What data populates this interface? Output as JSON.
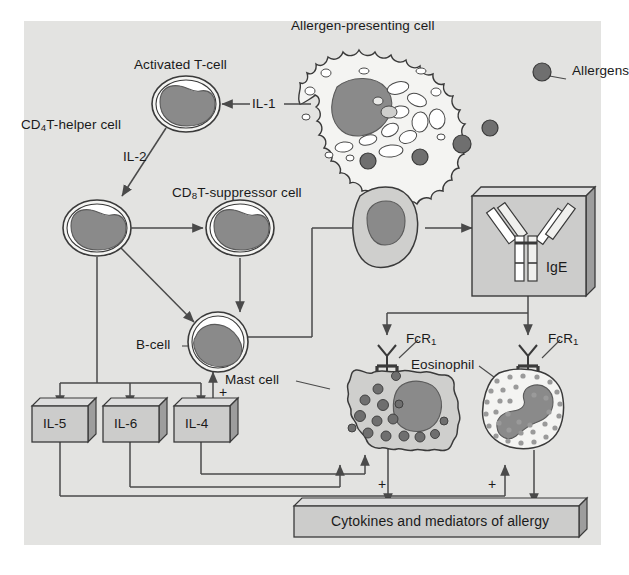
{
  "figure": {
    "background": "#e3e3e1",
    "page_background": "#ffffff",
    "ink": "#3a3a3a",
    "text_color": "#1a1a1a"
  },
  "palette": {
    "nucleus_gray": "#8a8a8a",
    "nucleus_dark": "#7e7e7e",
    "cytoplasm_light": "#f4f4f2",
    "cytoplasm_mid": "#d6d6d4",
    "allergen_dot": "#6f6f6f",
    "box_face": "#cccccb",
    "box_top": "#dedede",
    "box_side": "#9d9d9d",
    "mast_granule": "#6f6f6f",
    "eos_granule": "#9a9a9a",
    "line": "#4a4a4a"
  },
  "labels": {
    "allergen_presenting_cell": "Allergen-presenting cell",
    "allergens": "Allergens",
    "activated_t_cell": "Activated T-cell",
    "cd4_t_helper_cell_pre": "CD",
    "cd4_t_helper_cell_sub": "4",
    "cd4_t_helper_cell_post": "T-helper cell",
    "cd8_t_suppressor_cell_pre": "CD",
    "cd8_t_suppressor_cell_sub": "8",
    "cd8_t_suppressor_cell_post": "T-suppressor cell",
    "b_cell": "B-cell",
    "mast_cell": "Mast cell",
    "eosinophil": "Eosinophil",
    "ige": "IgE",
    "fcr1_pre": "FcR",
    "fcr1_sub": "1",
    "il_1": "IL-1",
    "il_2": "IL-2",
    "il_5": "IL-5",
    "il_6": "IL-6",
    "il_4": "IL-4",
    "cytokines_bar": "Cytokines and mediators of allergy",
    "plus_sign": "+"
  },
  "nodes": [
    {
      "id": "allergen-presenting-cell",
      "label": "Allergen-presenting cell",
      "type": "cell",
      "x": 368,
      "y": 110
    },
    {
      "id": "activated-t-cell",
      "label": "Activated T-cell",
      "type": "cell",
      "x": 180,
      "y": 105
    },
    {
      "id": "cd4-t-helper-cell",
      "label": "CD4 T-helper cell",
      "type": "cell",
      "x": 92,
      "y": 224
    },
    {
      "id": "cd8-t-suppressor-cell",
      "label": "CD8 T-suppressor cell",
      "type": "cell",
      "x": 239,
      "y": 227
    },
    {
      "id": "b-cell",
      "label": "B-cell",
      "type": "cell",
      "x": 216,
      "y": 342
    },
    {
      "id": "plasma-cell",
      "label": "Plasma cell",
      "type": "cell",
      "x": 390,
      "y": 228
    },
    {
      "id": "ige-box",
      "label": "IgE",
      "type": "box3d",
      "x": 540,
      "y": 240
    },
    {
      "id": "mast-cell",
      "label": "Mast cell",
      "type": "cell",
      "x": 378,
      "y": 412
    },
    {
      "id": "eosinophil",
      "label": "Eosinophil",
      "type": "cell",
      "x": 522,
      "y": 412
    },
    {
      "id": "il-5-box",
      "label": "IL-5",
      "type": "box3d",
      "x": 60,
      "y": 424
    },
    {
      "id": "il-6-box",
      "label": "IL-6",
      "type": "box3d",
      "x": 130,
      "y": 424
    },
    {
      "id": "il-4-box",
      "label": "IL-4",
      "type": "box3d",
      "x": 201,
      "y": 424
    },
    {
      "id": "cytokines-bar",
      "label": "Cytokines and mediators of allergy",
      "type": "box3d",
      "x": 400,
      "y": 521
    }
  ],
  "edges": [
    {
      "from": "allergen-presenting-cell",
      "to": "activated-t-cell",
      "label": "IL-1"
    },
    {
      "from": "activated-t-cell",
      "to": "cd4-t-helper-cell",
      "label": "IL-2"
    },
    {
      "from": "cd4-t-helper-cell",
      "to": "cd8-t-suppressor-cell",
      "label": "",
      "style": "double"
    },
    {
      "from": "cd4-t-helper-cell",
      "to": "b-cell",
      "label": ""
    },
    {
      "from": "cd8-t-suppressor-cell",
      "to": "b-cell",
      "label": ""
    },
    {
      "from": "b-cell",
      "to": "plasma-cell",
      "label": ""
    },
    {
      "from": "plasma-cell",
      "to": "ige-box",
      "label": ""
    },
    {
      "from": "ige-box",
      "to": "mast-cell",
      "label": ""
    },
    {
      "from": "ige-box",
      "to": "eosinophil",
      "label": ""
    },
    {
      "from": "cd4-t-helper-cell",
      "to": "il-5-box",
      "label": ""
    },
    {
      "from": "cd4-t-helper-cell",
      "to": "il-6-box",
      "label": ""
    },
    {
      "from": "cd4-t-helper-cell",
      "to": "il-4-box",
      "label": ""
    },
    {
      "from": "il-4-box",
      "to": "b-cell",
      "label": "+"
    },
    {
      "from": "il-5-box",
      "to": "eosinophil",
      "label": "+"
    },
    {
      "from": "il-6-box",
      "to": "mast-cell",
      "label": "+"
    },
    {
      "from": "mast-cell",
      "to": "cytokines-bar",
      "label": ""
    },
    {
      "from": "eosinophil",
      "to": "cytokines-bar",
      "label": ""
    }
  ]
}
